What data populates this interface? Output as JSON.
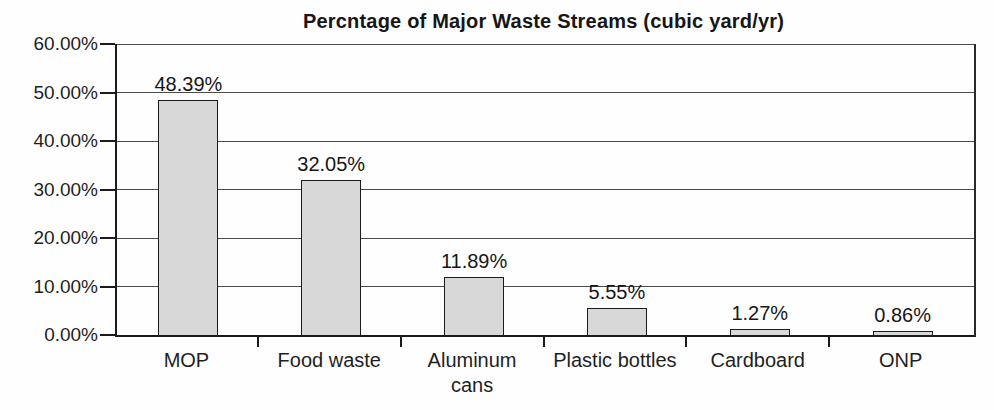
{
  "chart": {
    "title": "Percntage of Major Waste Streams (cubic yard/yr)"
  },
  "chart_data": {
    "type": "bar",
    "title": "Percntage of Major Waste Streams (cubic yard/yr)",
    "categories": [
      "MOP",
      "Food waste",
      "Aluminum cans",
      "Plastic bottles",
      "Cardboard",
      "ONP"
    ],
    "values": [
      48.39,
      32.05,
      11.89,
      5.55,
      1.27,
      0.86
    ],
    "data_labels": [
      "48.39%",
      "32.05%",
      "11.89%",
      "5.55%",
      "1.27%",
      "0.86%"
    ],
    "xlabel": "",
    "ylabel": "",
    "ylim": [
      0,
      60
    ],
    "ytick_step": 10,
    "ytick_labels": [
      "0.00%",
      "10.00%",
      "20.00%",
      "30.00%",
      "40.00%",
      "50.00%",
      "60.00%"
    ],
    "grid": true,
    "legend": false,
    "legend_position": "none",
    "colors": {
      "bar_fill": "#d8d8d8",
      "bar_border": "#1b1b1b",
      "axis_line": "#1b1b1b",
      "gridline": "#4a4a4a",
      "text": "#1b1b1b",
      "background": "#ffffff"
    }
  }
}
